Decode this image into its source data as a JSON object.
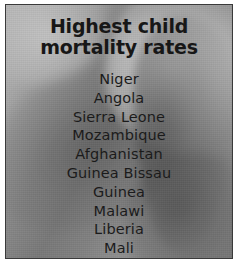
{
  "figure": {
    "kind": "photo-infographic-panel",
    "background_color": "#ffffff",
    "photo": {
      "description": "grayscale photograph of a child",
      "border_color": "#3a3a3a",
      "tone_light": "#bcbcbc",
      "tone_mid": "#8d8d8d",
      "tone_dark": "#5a5a5a"
    }
  },
  "caption": {
    "title_line_1": "Highest child",
    "title_line_2": "mortality rates",
    "title_color": "#171717",
    "list_color": "#1b1b1b",
    "countries": [
      "Niger",
      "Angola",
      "Sierra Leone",
      "Mozambique",
      "Afghanistan",
      "Guinea Bissau",
      "Guinea",
      "Malawi",
      "Liberia",
      "Mali"
    ]
  }
}
